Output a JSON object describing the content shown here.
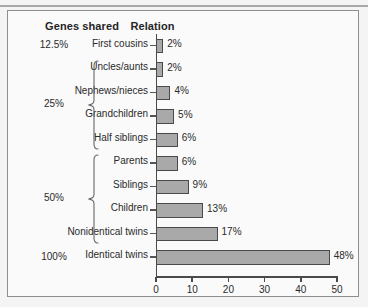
{
  "figure": {
    "headers": {
      "genes_shared": "Genes shared",
      "relation": "Relation"
    }
  },
  "chart_data": {
    "type": "bar",
    "orientation": "horizontal",
    "title": "",
    "xlabel": "",
    "ylabel": "",
    "xlim": [
      0,
      50
    ],
    "xticks": [
      0,
      10,
      20,
      30,
      40,
      50
    ],
    "xtick_labels": [
      "0",
      "10",
      "20",
      "30",
      "40",
      "50"
    ],
    "grid": false,
    "legend": null,
    "bar_color": "#a9a9a9",
    "bar_edge_color": "#4a4a4a",
    "categories": [
      "First cousins",
      "Uncles/aunts",
      "Nephews/nieces",
      "Grandchildren",
      "Half siblings",
      "Parents",
      "Siblings",
      "Children",
      "Nonidentical twins",
      "Identical twins"
    ],
    "values": [
      2,
      2,
      4,
      5,
      6,
      6,
      9,
      13,
      17,
      48
    ],
    "value_labels": [
      "2%",
      "2%",
      "4%",
      "5%",
      "6%",
      "6%",
      "9%",
      "13%",
      "17%",
      "48%"
    ],
    "groups": [
      {
        "label": "12.5%",
        "categories": [
          "First cousins"
        ],
        "brace": false
      },
      {
        "label": "25%",
        "categories": [
          "Uncles/aunts",
          "Nephews/nieces",
          "Grandchildren",
          "Half siblings"
        ],
        "brace": true
      },
      {
        "label": "50%",
        "categories": [
          "Parents",
          "Siblings",
          "Children",
          "Nonidentical twins"
        ],
        "brace": true
      },
      {
        "label": "100%",
        "categories": [
          "Identical twins"
        ],
        "brace": false
      }
    ]
  }
}
